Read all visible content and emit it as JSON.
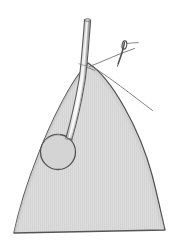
{
  "figure": {
    "background_color": "#ffffff",
    "width": 180,
    "height": 250,
    "alt_text": "Line drawing of a pointed dome-shaped tissue flap with a circular stoma opening, a drainage tube passing from the stoma up through the apex, and a curved suture needle with thread at the apex."
  },
  "palette": {
    "tissue_fill": "#d8d8d8",
    "tissue_fill_light": "#dedede",
    "outline_stroke": "#555555",
    "tube_fill": "#e4e4e4",
    "tube_highlight": "#fbfbfb",
    "tube_shadow": "#a8a8a8",
    "thread_stroke": "#6a6a6a",
    "needle_stroke": "#4f4f4f",
    "stoma_fill": "#d2d2d2",
    "texture_stroke": "#cfcfcf"
  },
  "elements": {
    "tissue_flap": {
      "name": "Tissue flap",
      "shape": "pointed arch / ogive with flat base",
      "apex": {
        "x": 88,
        "y": 63
      },
      "base_left": {
        "x": 14,
        "y": 233
      },
      "base_right": {
        "x": 165,
        "y": 230
      }
    },
    "stoma": {
      "name": "Stoma opening",
      "center": {
        "x": 58,
        "y": 152
      },
      "radius": 17.5
    },
    "drainage_tube": {
      "name": "Drainage tube",
      "entry_point": {
        "x": 69,
        "y": 136
      },
      "exit_point": {
        "x": 83,
        "y": 64
      },
      "tip": {
        "x": 88,
        "y": 18
      },
      "width": 6
    },
    "suture_needle": {
      "name": "Curved suture needle",
      "eye": {
        "x": 122,
        "y": 48
      },
      "tip": {
        "x": 119,
        "y": 62
      },
      "length": 18
    },
    "suture_threads": [
      {
        "name": "upper-thread",
        "from": {
          "x": 90,
          "y": 66
        },
        "to": {
          "x": 134,
          "y": 49
        }
      },
      {
        "name": "lower-thread",
        "from": {
          "x": 91,
          "y": 65
        },
        "to": {
          "x": 152,
          "y": 110
        }
      }
    ]
  }
}
